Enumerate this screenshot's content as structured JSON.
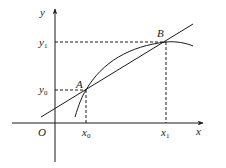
{
  "diagram": {
    "type": "secant-line-on-curve",
    "colors": {
      "stroke": "#1a1a1a",
      "background": "#ffffff"
    },
    "axes": {
      "x_label": "x",
      "y_label": "y",
      "origin_label": "O"
    },
    "points": {
      "A": {
        "label": "A",
        "x_label": "x",
        "x_sub": "0",
        "y_label": "y",
        "y_sub": "0"
      },
      "B": {
        "label": "B",
        "x_label": "x",
        "x_sub": "1",
        "y_label": "y",
        "y_sub": "1"
      }
    },
    "elements": [
      "curve through A and B",
      "secant line through A and B",
      "dashed projections from A and B to both axes"
    ]
  }
}
